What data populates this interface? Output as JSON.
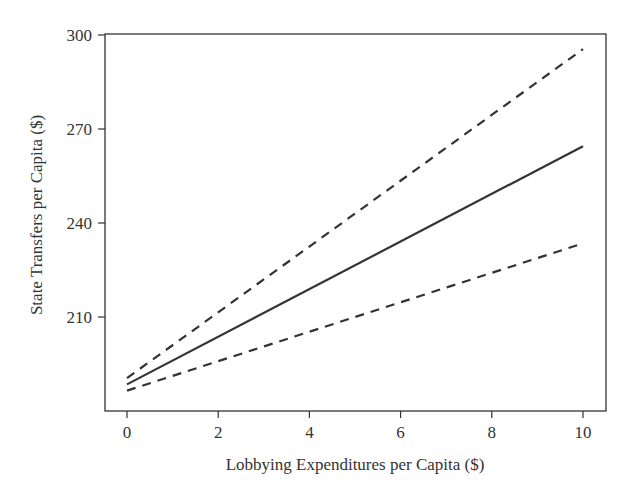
{
  "chart_data": {
    "type": "line",
    "title": "",
    "xlabel": "Lobbying Expenditures per Capita ($)",
    "ylabel": "State Transfers per Capita ($)",
    "xlim": [
      0,
      10
    ],
    "ylim": [
      180,
      300
    ],
    "x_ticks": [
      0,
      2,
      4,
      6,
      8,
      10
    ],
    "y_ticks": [
      210,
      240,
      270,
      300
    ],
    "grid": false,
    "legend": null,
    "x": [
      0,
      10
    ],
    "series": [
      {
        "name": "Predicted value",
        "style": "solid",
        "values": [
          188.5,
          264.5
        ]
      },
      {
        "name": "Upper 95% CI",
        "style": "dashed",
        "values": [
          190.5,
          295.5
        ]
      },
      {
        "name": "Lower 95% CI",
        "style": "dashed",
        "values": [
          186.5,
          233.5
        ]
      }
    ]
  },
  "axes": {
    "x_tick_labels": [
      "0",
      "2",
      "4",
      "6",
      "8",
      "10"
    ],
    "y_tick_labels": [
      "210",
      "240",
      "270",
      "300"
    ]
  }
}
